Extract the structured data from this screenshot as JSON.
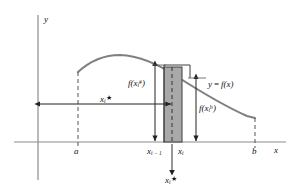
{
  "figure": {
    "background_color": "#ffffff",
    "curve_color": "#808080",
    "axis_color": "#8c8c8c",
    "rect_fill_color": "#a8a8a8",
    "rect_stroke_color": "#4d4d4d",
    "dash_color": "#555555",
    "arrow_color": "#222222",
    "text_color": "#111111"
  },
  "axes": {
    "y_axis_label": "y",
    "x_axis_label": "x",
    "x_axis_y_px": 142,
    "y_axis_x_px": 38
  },
  "points": {
    "a_label": "a",
    "b_label": "b",
    "x_left_base": "x",
    "x_left_sub": "i − 1",
    "x_right_base": "x",
    "x_right_sub": "i"
  },
  "curve": {
    "function_label_y": "y",
    "function_label_eq": "=",
    "function_label_f": "f",
    "function_label_arg": "(x)",
    "function_label_full": "y = f(x)",
    "start_px": [
      78,
      72
    ],
    "peak_px": [
      118,
      55
    ],
    "end_px": [
      255,
      118
    ]
  },
  "measurements": {
    "left_height": {
      "f": "f",
      "open": "(",
      "var": "x",
      "sub": "i",
      "sup": "#",
      "close": ")",
      "full": "f(xᵢ#)"
    },
    "right_height": {
      "f": "f",
      "open": "(",
      "var": "x",
      "sub": "i",
      "sup": "b",
      "close": ")",
      "full": "f(xᵢb)"
    },
    "horizontal_distance": {
      "var": "x",
      "sub": "i",
      "star": "★",
      "full": "xᵢ★"
    },
    "bottom_sample_point": {
      "var": "x",
      "sub": "i",
      "star": "★",
      "full": "xᵢ★"
    }
  },
  "rectangle": {
    "shaded_left_px": 164,
    "shaded_right_px": 182,
    "shaded_top_px": 67,
    "shaded_bottom_px": 142,
    "outline_right_px": 190,
    "outline_top_px": 65,
    "sample_line_px": 172
  }
}
